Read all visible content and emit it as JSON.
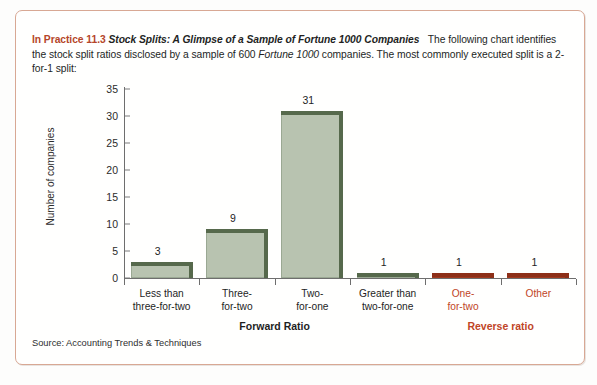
{
  "panel": {
    "border_color": "#d8a894",
    "intro": {
      "tag": "In Practice 11.3",
      "title": "Stock Splits: A Glimpse of a Sample of Fortune 1000 Companies",
      "body_part1": "The following chart identifies the stock split ratios disclosed by a sample of 600 ",
      "body_italic": "Fortune 1000",
      "body_part2": " companies. The most commonly executed split is a 2-for-1 split:"
    },
    "source": "Source: Accounting Trends & Techniques"
  },
  "chart_data": {
    "type": "bar",
    "title": "",
    "xlabel": "",
    "ylabel": "Number of companies",
    "ylim": [
      0,
      35
    ],
    "yticks": [
      0,
      5,
      10,
      15,
      20,
      25,
      30,
      35
    ],
    "grid": false,
    "legend": "none",
    "categories": [
      "Less than three-for-two",
      "Three-for-two",
      "Two-for-one",
      "Greater than two-for-one",
      "One-for-two",
      "Other"
    ],
    "category_lines": [
      [
        "Less than",
        "three-for-two"
      ],
      [
        "Three-",
        "for-two"
      ],
      [
        "Two-",
        "for-one"
      ],
      [
        "Greater than",
        "two-for-one"
      ],
      [
        "One-",
        "for-two"
      ],
      [
        "Other",
        ""
      ]
    ],
    "values": [
      3,
      9,
      31,
      1,
      1,
      1
    ],
    "bar_colors": [
      "green",
      "green",
      "green",
      "green",
      "red",
      "red"
    ],
    "group_labels": [
      {
        "text": "Forward Ratio",
        "kind": "fwd"
      },
      {
        "text": "Reverse ratio",
        "kind": "rev"
      }
    ],
    "colors": {
      "green_face": "#b8c3b0",
      "green_edge": "#56694c",
      "red_face": "#bf4527",
      "red_edge": "#8d2f18",
      "accent": "#bf4527"
    }
  }
}
